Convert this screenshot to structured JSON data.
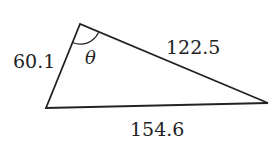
{
  "figure": {
    "type": "triangle",
    "vertices": {
      "top": [
        80,
        24
      ],
      "left": [
        46,
        108
      ],
      "right": [
        268,
        103
      ]
    },
    "sides": {
      "left": "60.1",
      "top_right": "122.5",
      "bottom": "154.6"
    },
    "angle_label": "θ",
    "stroke_color": "#222222"
  }
}
